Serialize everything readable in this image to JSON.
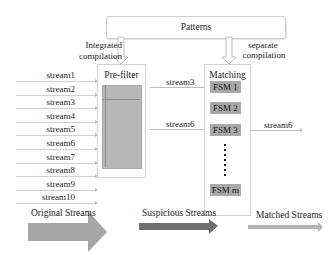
{
  "patterns": {
    "label": "Patterns"
  },
  "compilation": {
    "integrated": [
      "Integrated",
      "compilation"
    ],
    "separate": [
      "separate",
      "compilation"
    ]
  },
  "prefilter": {
    "label": "Pre-filter"
  },
  "matching": {
    "label": "Matching",
    "fsms": [
      "FSM 1",
      "FSM 2",
      "FSM 3",
      "FSM m"
    ],
    "ellipsis": "⋮"
  },
  "input_streams": [
    "stream1",
    "stream2",
    "stream3",
    "stream4",
    "stream5",
    "stream6",
    "stream7",
    "stream8",
    "stream9",
    "stream10"
  ],
  "suspicious_streams": [
    "stream3",
    "stream6"
  ],
  "matched_streams": [
    "stream6"
  ],
  "stage_arrows": {
    "original": {
      "label": "Original Streams",
      "color": "#a6a6a6"
    },
    "suspicious": {
      "label": "Suspicious Streams",
      "color": "#6f6f6f"
    },
    "matched": {
      "label": "Matched Streams",
      "color": "#b3b3b3"
    }
  }
}
